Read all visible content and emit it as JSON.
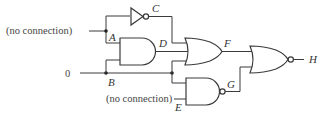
{
  "diagram": {
    "type": "logic-circuit",
    "inputs": [
      {
        "id": "A",
        "value_text": "(no connection)"
      },
      {
        "id": "B",
        "value_text": "0"
      },
      {
        "id": "E",
        "value_text": "(no connection)"
      }
    ],
    "labels": {
      "A": "A",
      "B": "B",
      "C": "C",
      "D": "D",
      "E": "E",
      "F": "F",
      "G": "G",
      "H": "H"
    },
    "input_texts": {
      "a_input": "(no connection)",
      "b_input": "0",
      "e_input": "(no connection)"
    },
    "gates": [
      {
        "name": "inverter",
        "type": "NOT",
        "inputs": [
          "A"
        ],
        "output": "C"
      },
      {
        "name": "and-gate",
        "type": "AND",
        "inputs": [
          "A",
          "B"
        ],
        "output": "D"
      },
      {
        "name": "or-gate",
        "type": "OR",
        "inputs": [
          "C",
          "D",
          "B"
        ],
        "output": "F"
      },
      {
        "name": "nand-gate",
        "type": "NAND",
        "inputs": [
          "B",
          "E"
        ],
        "output": "G"
      },
      {
        "name": "nor-gate",
        "type": "NOR",
        "inputs": [
          "F",
          "G"
        ],
        "output": "H"
      }
    ]
  }
}
